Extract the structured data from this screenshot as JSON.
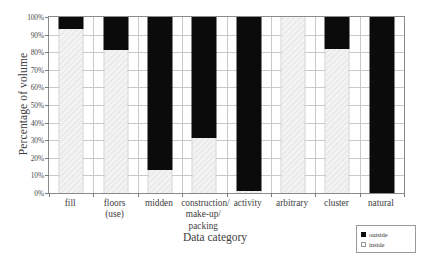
{
  "chart_data": {
    "type": "bar",
    "title": "",
    "xlabel": "Data category",
    "ylabel": "Percentage of volume",
    "categories": [
      "fill",
      "floors\n(use)",
      "midden",
      "construction/\nmake-up/\npacking",
      "activity",
      "arbitrary",
      "cluster",
      "natural"
    ],
    "series": [
      {
        "name": "outside",
        "values": [
          7,
          19,
          87,
          69,
          99,
          0,
          18,
          100
        ],
        "color": "#0b0b0b"
      },
      {
        "name": "inside",
        "values": [
          93,
          81,
          13,
          31,
          1,
          100,
          82,
          0
        ],
        "color": "#f2f2f2"
      }
    ],
    "stacked": true,
    "ylim": [
      0,
      100
    ],
    "ytick_labels": [
      "0%",
      "10%",
      "20%",
      "30%",
      "40%",
      "50%",
      "60%",
      "70%",
      "80%",
      "90%",
      "100%"
    ],
    "ytick_values": [
      0,
      10,
      20,
      30,
      40,
      50,
      60,
      70,
      80,
      90,
      100
    ],
    "grid": true,
    "legend_position": "bottom-right"
  },
  "legend": {
    "entries": [
      {
        "label": "outside",
        "swatch": "black-square"
      },
      {
        "label": "inside",
        "swatch": "white-square"
      }
    ]
  }
}
